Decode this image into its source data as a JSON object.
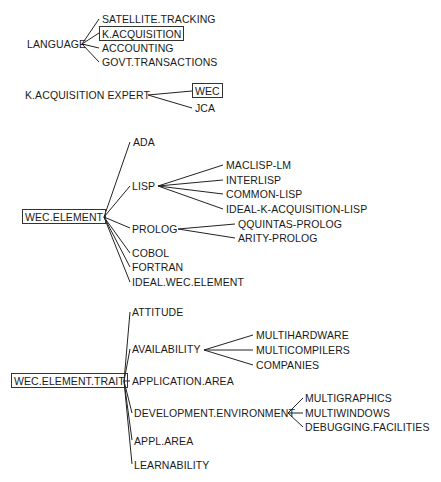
{
  "trees": [
    {
      "root": "LANGUAGE",
      "root_boxed": false,
      "children": [
        {
          "label": "SATELLITE.TRACKING",
          "boxed": false
        },
        {
          "label": "K.ACQUISITION",
          "boxed": true
        },
        {
          "label": "ACCOUNTING",
          "boxed": false
        },
        {
          "label": "GOVT.TRANSACTIONS",
          "boxed": false
        }
      ]
    },
    {
      "root": "K.ACQUISITION EXPERT",
      "root_boxed": false,
      "children": [
        {
          "label": "WEC",
          "boxed": true
        },
        {
          "label": "JCA",
          "boxed": false
        }
      ]
    },
    {
      "root": "WEC.ELEMENT",
      "root_boxed": true,
      "children": [
        {
          "label": "ADA"
        },
        {
          "label": "LISP",
          "children": [
            "MACLISP-LM",
            "INTERLISP",
            "COMMON-LISP",
            "IDEAL-K-ACQUISITION-LISP"
          ]
        },
        {
          "label": "PROLOG",
          "children": [
            "QQUINTAS-PROLOG",
            "ARITY-PROLOG"
          ]
        },
        {
          "label": "COBOL"
        },
        {
          "label": "FORTRAN"
        },
        {
          "label": "IDEAL.WEC.ELEMENT"
        }
      ]
    },
    {
      "root": "WEC.ELEMENT.TRAIT",
      "root_boxed": true,
      "children": [
        {
          "label": "ATTITUDE"
        },
        {
          "label": "AVAILABILITY",
          "children": [
            "MULTIHARDWARE",
            "MULTICOMPILERS",
            "COMPANIES"
          ]
        },
        {
          "label": "APPLICATION.AREA"
        },
        {
          "label": "DEVELOPMENT.ENVIRONMENT",
          "children": [
            "MULTIGRAPHICS",
            "MULTIWINDOWS",
            "DEBUGGING.FACILITIES"
          ]
        },
        {
          "label": "APPL.AREA"
        },
        {
          "label": "LEARNABILITY"
        }
      ]
    }
  ],
  "colors": {
    "line": "#222222",
    "text": "#1a1a1a",
    "background": "#ffffff"
  }
}
